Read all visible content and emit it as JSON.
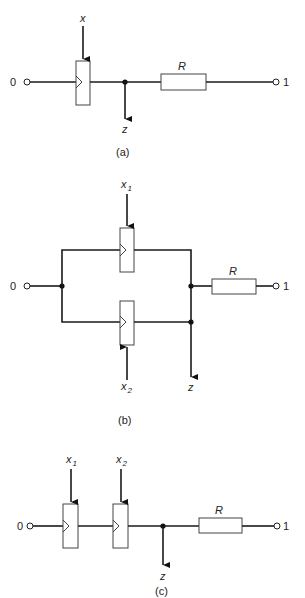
{
  "figure": {
    "panels": [
      {
        "id": "a",
        "caption": "(a)",
        "input_terminal": "0",
        "output_terminal": "1",
        "control_labels": [
          "x"
        ],
        "output_label": "z",
        "resistor_label": "R"
      },
      {
        "id": "b",
        "caption": "(b)",
        "input_terminal": "0",
        "output_terminal": "1",
        "control_labels": [
          "x",
          "x"
        ],
        "control_subscripts": [
          "1",
          "2"
        ],
        "output_label": "z",
        "resistor_label": "R"
      },
      {
        "id": "c",
        "caption": "(c)",
        "input_terminal": "0",
        "output_terminal": "1",
        "control_labels": [
          "x",
          "x"
        ],
        "control_subscripts": [
          "1",
          "2"
        ],
        "output_label": "z",
        "resistor_label": "R"
      }
    ]
  }
}
